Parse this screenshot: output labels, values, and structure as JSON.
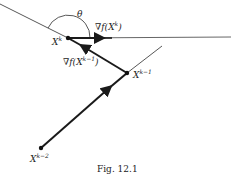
{
  "figure": {
    "caption": "Fig. 12.1",
    "angle_label": "θ",
    "points": {
      "xk": {
        "label": "X",
        "sup": "k",
        "x": 68,
        "y": 38
      },
      "xk1": {
        "label": "X",
        "sup": "k−1",
        "x": 127,
        "y": 73
      },
      "xk2": {
        "label": "X",
        "sup": "k−2",
        "x": 41,
        "y": 148
      }
    },
    "gradients": {
      "grad_xk": {
        "prefix": "∇f(X",
        "sup": "k",
        "suffix": ")"
      },
      "grad_xk1": {
        "prefix": "∇f(X",
        "sup": "k−1",
        "suffix": ")"
      }
    },
    "colors": {
      "line": "#333333",
      "bold": "#1a1a1a"
    }
  }
}
